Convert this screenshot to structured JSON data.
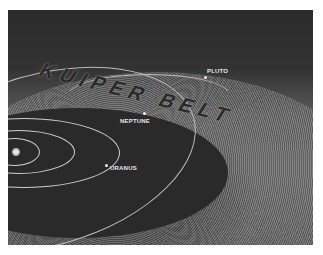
{
  "image": {
    "title_text": "KUIPER BELT",
    "labels": {
      "pluto": "PLUTO",
      "neptune": "NEPTUNE",
      "uranus": "URANUS"
    }
  }
}
